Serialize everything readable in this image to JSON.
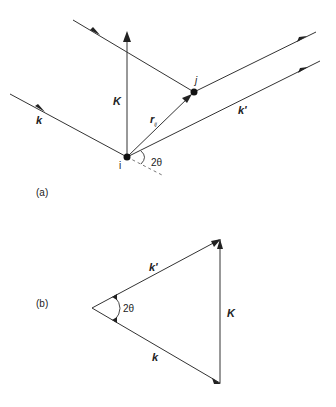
{
  "figure": {
    "panel_a": {
      "label": "(a)",
      "vector_K": "K",
      "vector_k": "k",
      "vector_k_prime": "k'",
      "vector_r": "r",
      "vector_r_sub": "ij",
      "point_i": "i",
      "point_j": "j",
      "angle": "2θ"
    },
    "panel_b": {
      "label": "(b)",
      "vector_K": "K",
      "vector_k": "k",
      "vector_k_prime": "k'",
      "angle": "2θ"
    }
  },
  "colors": {
    "line": "#333333",
    "background": "#ffffff"
  }
}
